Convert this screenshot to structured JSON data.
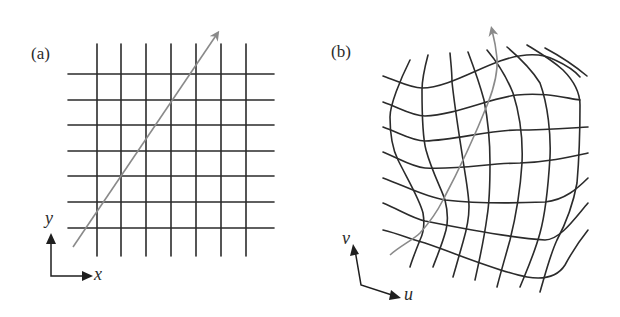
{
  "figure": {
    "panels": [
      {
        "id": "a",
        "label": "(a)",
        "axes": {
          "horizontal": "x",
          "vertical": "y"
        },
        "grid": {
          "rows": 7,
          "cols": 7,
          "type": "regular"
        },
        "path_color": "#8a8a8a"
      },
      {
        "id": "b",
        "label": "(b)",
        "axes": {
          "horizontal": "u",
          "vertical": "v"
        },
        "grid": {
          "rows": 7,
          "cols": 7,
          "type": "curvilinear"
        },
        "path_color": "#8a8a8a"
      }
    ],
    "grid_color": "#2b2b2b"
  }
}
